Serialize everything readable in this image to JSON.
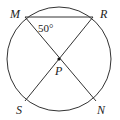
{
  "diagram": {
    "type": "circle-geometry",
    "points": {
      "M": {
        "label": "M",
        "x": 25,
        "y": 17
      },
      "R": {
        "label": "R",
        "x": 93,
        "y": 17
      },
      "S": {
        "label": "S",
        "x": 25,
        "y": 101
      },
      "N": {
        "label": "N",
        "x": 95,
        "y": 101
      },
      "P": {
        "label": "P",
        "x": 59,
        "y": 59
      }
    },
    "angle_label": "50°",
    "segments": [
      "MR",
      "MN",
      "RS"
    ],
    "circle": {
      "cx": 59,
      "cy": 59,
      "r": 52
    }
  }
}
